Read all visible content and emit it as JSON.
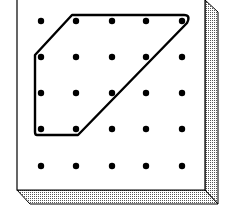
{
  "diagram": {
    "grid": {
      "rows": 5,
      "cols": 5,
      "xs": [
        41,
        76,
        112,
        146,
        182
      ],
      "ys": [
        21,
        57,
        93,
        129,
        166
      ],
      "peg_radius": 3.2,
      "peg_color": "#000000"
    },
    "board": {
      "face_color": "#ffffff",
      "edge_color": "#000000",
      "shade_color": "#9a9a9a"
    },
    "polygon": {
      "description": "Hexagon-like band around pegs: (col1,row0) to (col4,row0), diagonal to (col1,row3), to (col0,row3), up to (col0,row1), diagonal back",
      "vertices_pegs": [
        [
          1,
          0
        ],
        [
          4,
          0
        ],
        [
          1,
          3
        ],
        [
          0,
          3
        ],
        [
          0,
          1
        ]
      ],
      "stroke_color": "#000000",
      "stroke_width": 2.4
    }
  }
}
